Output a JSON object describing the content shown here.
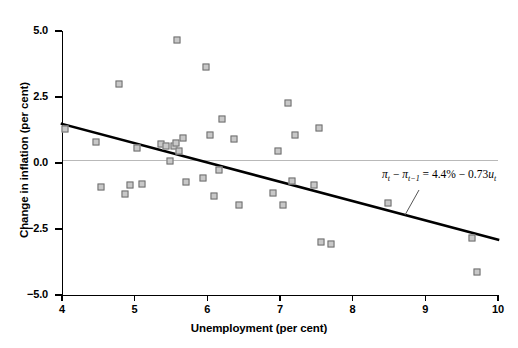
{
  "chart_data": {
    "type": "scatter",
    "title": "",
    "xlabel": "Unemployment (per cent)",
    "ylabel": "Change in inflation (per cent)",
    "xlim": [
      4,
      10
    ],
    "ylim": [
      -5.0,
      5.0
    ],
    "xticks": [
      4,
      5,
      6,
      7,
      8,
      9,
      10
    ],
    "xtick_labels": [
      "4",
      "5",
      "6",
      "7",
      "8",
      "9",
      "10"
    ],
    "yticks": [
      5.0,
      2.5,
      0.0,
      -2.5,
      -5.0
    ],
    "ytick_labels": [
      "5.0",
      "2.5",
      "0.0",
      "-2.5",
      "-5.0"
    ],
    "grid": "zero-line-only",
    "legend": "none",
    "marker": "open-square-grey",
    "points": [
      {
        "x": 4.05,
        "y": 1.25
      },
      {
        "x": 4.48,
        "y": 0.75
      },
      {
        "x": 4.55,
        "y": -0.95
      },
      {
        "x": 4.8,
        "y": 2.95
      },
      {
        "x": 4.88,
        "y": -1.22
      },
      {
        "x": 4.95,
        "y": -0.88
      },
      {
        "x": 5.05,
        "y": 0.52
      },
      {
        "x": 5.12,
        "y": -0.85
      },
      {
        "x": 5.38,
        "y": 0.68
      },
      {
        "x": 5.45,
        "y": 0.62
      },
      {
        "x": 5.5,
        "y": 0.05
      },
      {
        "x": 5.55,
        "y": 0.62
      },
      {
        "x": 5.58,
        "y": 0.72
      },
      {
        "x": 5.6,
        "y": 4.62
      },
      {
        "x": 5.62,
        "y": 0.4
      },
      {
        "x": 5.68,
        "y": 0.92
      },
      {
        "x": 5.72,
        "y": -0.75
      },
      {
        "x": 5.95,
        "y": -0.6
      },
      {
        "x": 6.0,
        "y": 3.6
      },
      {
        "x": 6.05,
        "y": 1.02
      },
      {
        "x": 6.1,
        "y": -1.3
      },
      {
        "x": 6.18,
        "y": -0.32
      },
      {
        "x": 6.22,
        "y": 1.62
      },
      {
        "x": 6.38,
        "y": 0.88
      },
      {
        "x": 6.45,
        "y": -1.62
      },
      {
        "x": 6.92,
        "y": -1.18
      },
      {
        "x": 6.98,
        "y": 0.4
      },
      {
        "x": 7.05,
        "y": -1.62
      },
      {
        "x": 7.12,
        "y": 2.22
      },
      {
        "x": 7.18,
        "y": -0.72
      },
      {
        "x": 7.22,
        "y": 1.02
      },
      {
        "x": 7.48,
        "y": -0.88
      },
      {
        "x": 7.55,
        "y": 1.3
      },
      {
        "x": 7.58,
        "y": -3.02
      },
      {
        "x": 7.72,
        "y": -3.12
      },
      {
        "x": 8.5,
        "y": -1.55
      },
      {
        "x": 9.65,
        "y": -2.88
      },
      {
        "x": 9.72,
        "y": -4.15
      }
    ],
    "regression_line": {
      "x0": 4.0,
      "y0": 1.48,
      "x1": 10.0,
      "y1": -2.9,
      "slope": -0.73,
      "intercept": 4.4
    },
    "annotation": {
      "lhs_pi": "π",
      "lhs_sub": "t",
      "minus": "−",
      "lhs_pi2": "π",
      "lhs_sub2": "t−1",
      "equals": "=",
      "rhs_const": "4.4%",
      "rhs_minus": "−",
      "rhs_coef": "0.73",
      "rhs_var": "u",
      "rhs_var_sub": "t",
      "full_text": "πt − πt−1 = 4.4% − 0.73ut"
    },
    "colors": {
      "marker_fill": "#c8c8c8",
      "marker_edge": "#6e6e6e",
      "axis": "#000000",
      "gridline": "#b9b9b9",
      "regression": "#000000",
      "leader": "#555555"
    }
  }
}
